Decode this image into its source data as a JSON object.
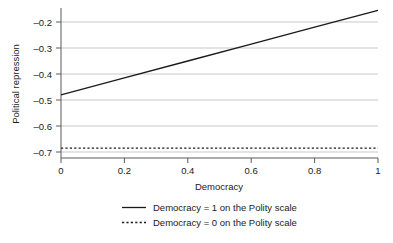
{
  "chart_data": {
    "type": "line",
    "title": "",
    "subtitle": "",
    "xlabel": "Democracy",
    "ylabel": "Political repression",
    "xlim": [
      0,
      1
    ],
    "ylim": [
      -0.72,
      -0.15
    ],
    "xticks": [
      0,
      0.2,
      0.4,
      0.6,
      0.8,
      1
    ],
    "xtick_labels": [
      "0",
      "0.2",
      "0.4",
      "0.6",
      "0.8",
      "1"
    ],
    "yticks": [
      -0.2,
      -0.3,
      -0.4,
      -0.5,
      -0.6,
      -0.7
    ],
    "ytick_labels": [
      "–0.2",
      "–0.3",
      "–0.4",
      "–0.5",
      "–0.6",
      "–0.7"
    ],
    "grid": true,
    "grid_axis": "y",
    "grid_color": "#c8c8c8",
    "legend_position": "bottom",
    "series": [
      {
        "name": "Democracy = 1 on the Polity scale",
        "style": "solid",
        "color": "#1a1a1a",
        "x": [
          0,
          0.2,
          0.4,
          0.6,
          0.8,
          1
        ],
        "values": [
          -0.48,
          -0.415,
          -0.35,
          -0.285,
          -0.22,
          -0.155
        ]
      },
      {
        "name": "Democracy = 0 on the Polity scale",
        "style": "dashed",
        "color": "#1a1a1a",
        "x": [
          0,
          0.2,
          0.4,
          0.6,
          0.8,
          1
        ],
        "values": [
          -0.685,
          -0.685,
          -0.685,
          -0.685,
          -0.685,
          -0.685
        ]
      }
    ]
  },
  "axes": {
    "x_title": "Democracy",
    "y_title": "Political repression",
    "x_ticks": [
      "0",
      "0.2",
      "0.4",
      "0.6",
      "0.8",
      "1"
    ],
    "y_ticks": [
      "–0.2",
      "–0.3",
      "–0.4",
      "–0.5",
      "–0.6",
      "–0.7"
    ]
  },
  "legend": {
    "entries": [
      {
        "label": "Democracy = 1 on the Polity scale",
        "style": "solid"
      },
      {
        "label": "Democracy = 0 on the Polity scale",
        "style": "dashed"
      }
    ]
  },
  "colors": {
    "line": "#1a1a1a",
    "grid": "#c8c8c8",
    "axis": "#5a5a5a",
    "background": "#ffffff"
  }
}
